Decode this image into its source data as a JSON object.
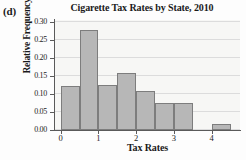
{
  "panel_label": "(d)",
  "chart_data": {
    "type": "bar",
    "title": "Cigarette Tax Rates by State, 2010",
    "xlabel": "Tax Rates",
    "ylabel": "Relative Frequency",
    "xlim": [
      -0.15,
      4.75
    ],
    "ylim": [
      0.0,
      0.305
    ],
    "grid": true,
    "legend": null,
    "bin_width": 0.5,
    "bin_starts": [
      0.0,
      0.5,
      1.0,
      1.5,
      2.0,
      2.5,
      3.0,
      3.5,
      4.0
    ],
    "bin_ends": [
      0.5,
      1.0,
      1.5,
      2.0,
      2.5,
      3.0,
      3.5,
      4.0,
      4.5
    ],
    "categories": [
      "0.0-0.5",
      "0.5-1.0",
      "1.0-1.5",
      "1.5-2.0",
      "2.0-2.5",
      "2.5-3.0",
      "3.0-3.5",
      "3.5-4.0",
      "4.0-4.5"
    ],
    "values": [
      0.123,
      0.276,
      0.124,
      0.157,
      0.108,
      0.074,
      0.074,
      0.0,
      0.017
    ],
    "xticks": [
      0,
      1,
      2,
      3,
      4
    ],
    "xtick_labels": [
      "0",
      "1",
      "2",
      "3",
      "4"
    ],
    "yticks": [
      0.0,
      0.05,
      0.1,
      0.15,
      0.2,
      0.25,
      0.3
    ],
    "ytick_labels": [
      "0.00",
      "0.05",
      "0.10",
      "0.15",
      "0.20",
      "0.25",
      "0.30"
    ],
    "colors": {
      "bar_fill": "#b7b7b7",
      "bar_edge": "#7d7d7d",
      "plot_background": "#f7f7f5",
      "gridline": "#dcdcdc",
      "axis": "#5a5a5a",
      "text": "#1a1a1a"
    }
  }
}
